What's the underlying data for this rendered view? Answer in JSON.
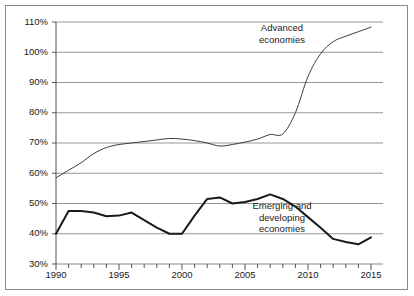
{
  "chart_data": {
    "type": "line",
    "title": "",
    "subtitle": "",
    "xlabel": "",
    "ylabel": "",
    "xlim": [
      1990,
      2015
    ],
    "ylim": [
      30,
      110
    ],
    "ytick_labels": [
      "110%",
      "100%",
      "90%",
      "80%",
      "70%",
      "60%",
      "50%",
      "40%",
      "30%"
    ],
    "ytick_values": [
      110,
      100,
      90,
      80,
      70,
      60,
      50,
      40,
      30
    ],
    "xtick_labels": [
      "1990",
      "1995",
      "2000",
      "2005",
      "2010",
      "2015"
    ],
    "xtick_values": [
      1990,
      1995,
      2000,
      2005,
      2010,
      2015
    ],
    "xminor_step": 1,
    "grid": "horizontal",
    "legend_position": "inline-annotation",
    "x": [
      1990,
      1991,
      1992,
      1993,
      1994,
      1995,
      1996,
      1997,
      1998,
      1999,
      2000,
      2001,
      2002,
      2003,
      2004,
      2005,
      2006,
      2007,
      2008,
      2009,
      2010,
      2011,
      2012,
      2013,
      2014,
      2015
    ],
    "series": [
      {
        "name": "Advanced economies",
        "label_lines": [
          "Advanced",
          "economies"
        ],
        "color": "#3c3c3c",
        "line_width": 1.0,
        "values": [
          58.5,
          61.0,
          63.5,
          66.5,
          68.5,
          69.5,
          70.0,
          70.5,
          71.0,
          71.5,
          71.3,
          70.8,
          70.0,
          69.0,
          69.5,
          70.3,
          71.3,
          72.8,
          73.0,
          80.0,
          92.0,
          99.5,
          103.5,
          105.3,
          106.8,
          108.3
        ]
      },
      {
        "name": "Emerging and developing economies",
        "label_lines": [
          "Emerging and",
          "developing",
          "economies"
        ],
        "color": "#1a1a1a",
        "line_width": 2.0,
        "values": [
          40.0,
          47.5,
          47.5,
          47.0,
          45.8,
          46.0,
          47.0,
          44.5,
          42.0,
          40.0,
          40.0,
          46.0,
          51.5,
          52.0,
          50.0,
          50.5,
          51.5,
          53.0,
          51.5,
          49.0,
          45.5,
          42.0,
          38.3,
          37.3,
          36.5,
          38.8
        ]
      }
    ],
    "annotations": [
      {
        "id": "advanced-label",
        "text": "Advanced economies",
        "x_pct": 0.655,
        "y_pct": 0.055
      },
      {
        "id": "emerging-label",
        "text": "Emerging and developing economies",
        "x_pct": 0.665,
        "y_pct": 0.68
      }
    ]
  },
  "axis": {
    "y_labels": [
      "110%",
      "100%",
      "90%",
      "80%",
      "70%",
      "60%",
      "50%",
      "40%",
      "30%"
    ],
    "x_labels": [
      "1990",
      "1995",
      "2000",
      "2005",
      "2010",
      "2015"
    ]
  },
  "labels": {
    "advanced_line1": "Advanced",
    "advanced_line2": "economies",
    "emerging_line1": "Emerging and",
    "emerging_line2": "developing",
    "emerging_line3": "economies"
  },
  "colors": {
    "frame": "#8a8a8a",
    "gridline": "#8a8a8a",
    "axis": "#555555",
    "advanced_series": "#3c3c3c",
    "emerging_series": "#1a1a1a",
    "text": "#1a1a1a",
    "background": "#ffffff"
  }
}
